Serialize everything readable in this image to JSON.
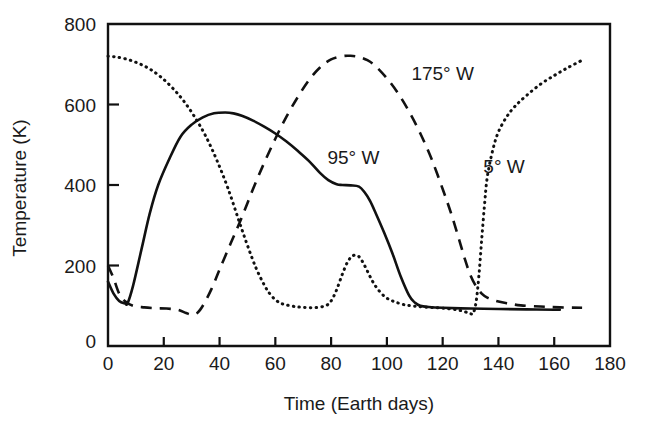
{
  "chart_data": {
    "type": "line",
    "title": "",
    "xlabel": "Time (Earth days)",
    "ylabel": "Temperature (K)",
    "xlim": [
      0,
      180
    ],
    "ylim": [
      0,
      800
    ],
    "xticks": [
      0,
      20,
      40,
      60,
      80,
      100,
      120,
      140,
      160,
      180
    ],
    "xticklabels": [
      "0",
      "20",
      "40",
      "60",
      "80",
      "100",
      "120",
      "140",
      "160",
      "180"
    ],
    "yticks": [
      0,
      200,
      400,
      600,
      800
    ],
    "yticklabels": [
      "0",
      "200",
      "400",
      "600",
      "800"
    ],
    "grid": false,
    "legend_position": "inline-annotations",
    "series": [
      {
        "name": "95° W",
        "style": "solid",
        "label": "95° W",
        "label_x": 88,
        "label_y": 452,
        "x": [
          0,
          2,
          4,
          6,
          7,
          9,
          12,
          15,
          18,
          22,
          26,
          30,
          34,
          38,
          42,
          45,
          48,
          52,
          56,
          60,
          64,
          68,
          72,
          76,
          79,
          82,
          84,
          87,
          90,
          92,
          94,
          96,
          99,
          102,
          105,
          108,
          110,
          112,
          115,
          120,
          130,
          140,
          150,
          160,
          162
        ],
        "y": [
          160,
          130,
          112,
          106,
          106,
          150,
          240,
          330,
          400,
          465,
          520,
          550,
          568,
          578,
          580,
          578,
          572,
          560,
          545,
          528,
          508,
          485,
          460,
          430,
          412,
          402,
          400,
          399,
          396,
          382,
          360,
          330,
          282,
          230,
          172,
          125,
          108,
          100,
          97,
          95,
          93,
          92,
          91,
          90,
          90
        ]
      },
      {
        "name": "175° W",
        "style": "dashed",
        "label": "175° W",
        "label_x": 120,
        "label_y": 660,
        "x": [
          0,
          2,
          4,
          6,
          9,
          13,
          17,
          21,
          25,
          28,
          30,
          32,
          34,
          37,
          40,
          44,
          48,
          52,
          56,
          60,
          64,
          68,
          72,
          76,
          80,
          84,
          87,
          90,
          93,
          96,
          100,
          104,
          108,
          112,
          116,
          120,
          123,
          126,
          128,
          130,
          132,
          134,
          136,
          139,
          143,
          148,
          155,
          162,
          170
        ],
        "y": [
          200,
          168,
          130,
          112,
          100,
          96,
          94,
          93,
          90,
          82,
          78,
          82,
          100,
          140,
          190,
          255,
          320,
          390,
          455,
          515,
          570,
          618,
          660,
          692,
          712,
          720,
          721,
          718,
          710,
          695,
          665,
          628,
          582,
          528,
          465,
          390,
          330,
          262,
          215,
          175,
          148,
          130,
          120,
          112,
          106,
          101,
          98,
          96,
          95
        ]
      },
      {
        "name": "5° W",
        "style": "dotted",
        "label": "5° W",
        "label_x": 142,
        "label_y": 430,
        "x": [
          0,
          3,
          7,
          11,
          15,
          19,
          23,
          27,
          31,
          35,
          39,
          43,
          47,
          50,
          53,
          56,
          58,
          60,
          62,
          64,
          67,
          70,
          74,
          78,
          80,
          82,
          84,
          86,
          88,
          90,
          92,
          94,
          96,
          99,
          102,
          106,
          110,
          115,
          120,
          125,
          128,
          130,
          131,
          132,
          133,
          134,
          135,
          136,
          138,
          140,
          143,
          146,
          150,
          155,
          160,
          165,
          170
        ],
        "y": [
          720,
          718,
          712,
          702,
          688,
          668,
          642,
          610,
          570,
          522,
          462,
          392,
          310,
          250,
          195,
          152,
          130,
          115,
          106,
          102,
          98,
          96,
          95,
          100,
          112,
          140,
          178,
          210,
          225,
          222,
          200,
          172,
          148,
          124,
          112,
          103,
          99,
          96,
          94,
          90,
          85,
          80,
          82,
          110,
          175,
          265,
          350,
          420,
          488,
          532,
          570,
          596,
          622,
          650,
          672,
          692,
          710
        ]
      }
    ]
  }
}
